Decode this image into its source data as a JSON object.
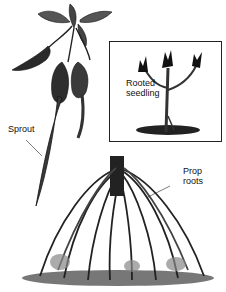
{
  "figure": {
    "labels": {
      "sprout": "Sprout",
      "rooted_seedling_line1": "Rooted",
      "rooted_seedling_line2": "seedling",
      "prop_roots_line1": "Prop",
      "prop_roots_line2": "roots"
    },
    "colors": {
      "ink": "#111111",
      "background": "#ffffff",
      "shade": "#555555"
    }
  }
}
